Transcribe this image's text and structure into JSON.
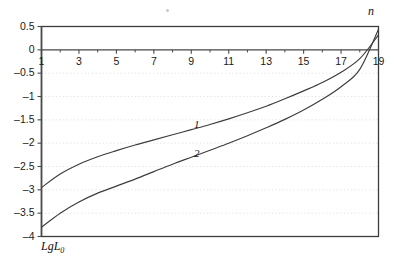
{
  "chart_data": {
    "type": "line",
    "title": "",
    "subtitle": "",
    "xlabel": "n",
    "ylabel": "LgL",
    "ylabel_sub": "0",
    "xlim": [
      1,
      19
    ],
    "ylim": [
      -4,
      0.5
    ],
    "grid": "horizontal-dotted",
    "legend_position": "inline-curve-labels",
    "x_ticks": [
      1,
      3,
      5,
      7,
      9,
      11,
      13,
      15,
      17,
      19
    ],
    "x_tick_labels": [
      "1",
      "3",
      "5",
      "7",
      "9",
      "11",
      "13",
      "15",
      "17",
      "19"
    ],
    "x_minor_ticks": [
      2,
      4,
      6,
      8,
      10,
      12,
      14,
      16,
      18
    ],
    "y_ticks": [
      0.5,
      0,
      -0.5,
      -1,
      -1.5,
      -2,
      -2.5,
      -3,
      -3.5,
      -4
    ],
    "y_tick_labels": [
      "0.5",
      "0",
      "–0.5",
      "–1",
      "–1.5",
      "–2",
      "–2.5",
      "–3",
      "–3.5",
      "–4"
    ],
    "x": [
      1,
      2,
      3,
      4,
      5,
      6,
      7,
      8,
      9,
      10,
      11,
      12,
      13,
      14,
      15,
      16,
      17,
      18,
      19
    ],
    "series": [
      {
        "name": "1",
        "label": "1",
        "label_x": 9.3,
        "label_y": -1.62,
        "color": "#3d3d3d",
        "values": [
          -2.95,
          -2.66,
          -2.45,
          -2.29,
          -2.16,
          -2.04,
          -1.93,
          -1.82,
          -1.71,
          -1.6,
          -1.48,
          -1.35,
          -1.21,
          -1.05,
          -0.88,
          -0.7,
          -0.48,
          -0.19,
          0.32
        ]
      },
      {
        "name": "2",
        "label": "2",
        "label_x": 9.3,
        "label_y": -2.23,
        "color": "#3d3d3d",
        "values": [
          -3.8,
          -3.5,
          -3.26,
          -3.07,
          -2.92,
          -2.77,
          -2.61,
          -2.45,
          -2.3,
          -2.15,
          -2.0,
          -1.84,
          -1.67,
          -1.49,
          -1.29,
          -1.06,
          -0.79,
          -0.42,
          0.44
        ]
      }
    ],
    "colors": {
      "frame": "#3c3c3c",
      "axis": "#4a4a4a",
      "grid": "#d9d9d9",
      "curve": "#3d3d3d",
      "text": "#1a1a1a",
      "background": "#ffffff"
    }
  }
}
